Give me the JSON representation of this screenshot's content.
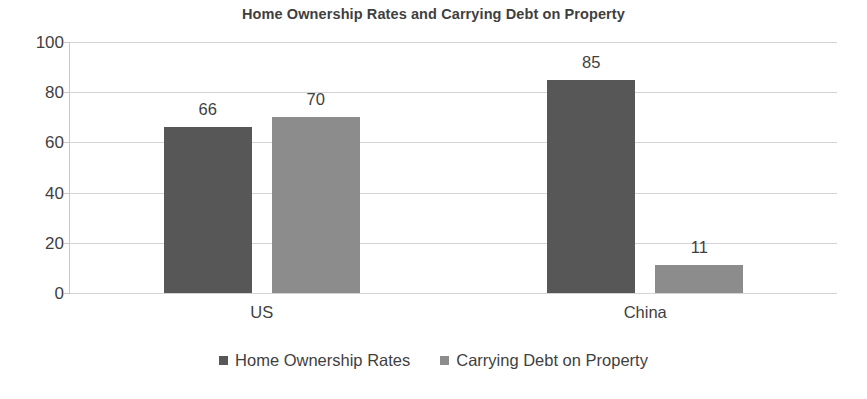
{
  "chart_data": {
    "type": "bar",
    "title": "Home Ownership Rates and Carrying Debt on Property",
    "xlabel": "",
    "ylabel": "",
    "categories": [
      "US",
      "China"
    ],
    "series": [
      {
        "name": "Home Ownership Rates",
        "color": "#575757",
        "values": [
          66,
          85
        ]
      },
      {
        "name": "Carrying Debt on Property",
        "color": "#8c8c8c",
        "values": [
          70,
          11
        ]
      }
    ],
    "ylim": [
      0,
      100
    ],
    "y_ticks": [
      0,
      20,
      40,
      60,
      80,
      100
    ],
    "y_tick_labels": [
      "0",
      "20",
      "40",
      "60",
      "80",
      "100"
    ],
    "grid": true,
    "grid_axis": "y",
    "data_labels": [
      "66",
      "70",
      "85",
      "11"
    ],
    "legend_position": "bottom",
    "legend": [
      "Home Ownership Rates",
      "Carrying Debt on Property"
    ],
    "background_color": "#ffffff",
    "text_color": "#3f3f3f",
    "gridline_color": "#d3d3d3"
  }
}
